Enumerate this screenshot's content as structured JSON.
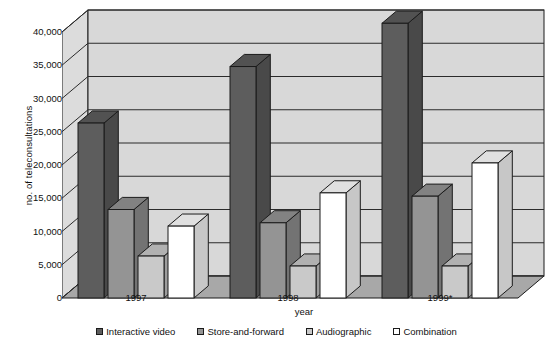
{
  "chart_data": {
    "type": "bar",
    "title": "",
    "xlabel": "year",
    "ylabel": "no. of teleconsultations",
    "categories": [
      "1997",
      "1998",
      "1999*"
    ],
    "series": [
      {
        "name": "Interactive video",
        "values": [
          23000,
          31500,
          38000
        ],
        "color": "#5d5d5d"
      },
      {
        "name": "Store-and-forward",
        "values": [
          10000,
          8000,
          12000
        ],
        "color": "#949494"
      },
      {
        "name": "Audiographic",
        "values": [
          3000,
          1500,
          1500
        ],
        "color": "#c9c9c9"
      },
      {
        "name": "Combination",
        "values": [
          7500,
          12500,
          17000
        ],
        "color": "#ffffff"
      }
    ],
    "ylim": [
      0,
      40000
    ],
    "ytick_values": [
      0,
      5000,
      10000,
      15000,
      20000,
      25000,
      30000,
      35000,
      40000
    ],
    "ytick_labels": [
      "0",
      "5,000",
      "10,000",
      "15,000",
      "20,000",
      "25,000",
      "30,000",
      "35,000",
      "40,000"
    ],
    "grid": true,
    "legend_position": "bottom",
    "style": "3d-column",
    "plot_background": "#d2d2d2",
    "wall_background": "#d8d8d8",
    "floor_background": "#a8a8a8",
    "gridline_color": "#2b2b2b",
    "axis_color": "#1b1b1b"
  },
  "legend": {
    "items": [
      {
        "label": "Interactive video",
        "color": "#5d5d5d"
      },
      {
        "label": "Store-and-forward",
        "color": "#949494"
      },
      {
        "label": "Audiographic",
        "color": "#c9c9c9"
      },
      {
        "label": "Combination",
        "color": "#ffffff"
      }
    ]
  },
  "axes": {
    "y_title": "no. of teleconsultations",
    "x_title": "year"
  }
}
